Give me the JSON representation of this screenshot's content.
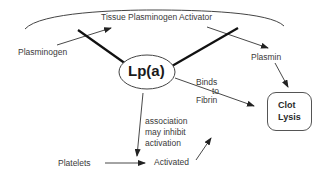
{
  "diagram": {
    "nodes": {
      "tpa": "Tissue Plasminogen Activator",
      "plasminogen": "Plasminogen",
      "plasmin": "Plasmin",
      "lpa": "Lp(a)",
      "clot_lysis": [
        "Clot",
        "Lysis"
      ],
      "platelets": "Platelets",
      "activated": "Activated"
    },
    "edge_labels": {
      "binds_to_fibrin": [
        "Binds",
        "to",
        "Fibrin"
      ],
      "association": [
        "association",
        "may inhibit",
        "activation"
      ]
    },
    "edges": [
      {
        "from": "Plasminogen",
        "to": "Tissue Plasminogen Activator"
      },
      {
        "from": "Tissue Plasminogen Activator",
        "to": "Plasmin"
      },
      {
        "from": "Plasmin",
        "to": "Clot Lysis"
      },
      {
        "from": "Lp(a)",
        "to": "Clot Lysis",
        "label": "Binds to Fibrin"
      },
      {
        "from": "Lp(a)",
        "to": "Platelets",
        "label": "association may inhibit activation"
      },
      {
        "from": "Platelets",
        "to": "Activated"
      },
      {
        "from": "Activated",
        "to": "Clot Lysis"
      }
    ]
  }
}
